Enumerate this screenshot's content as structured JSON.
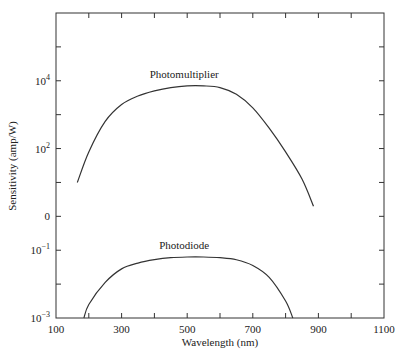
{
  "chart_data": {
    "type": "line",
    "title": "",
    "xlabel": "Wavelength (nm)",
    "ylabel": "Sensitivity (amp/W)",
    "xlim": [
      100,
      1100
    ],
    "x_ticks": [
      100,
      300,
      500,
      700,
      900,
      1100
    ],
    "x_minor_ticks": [
      200,
      400,
      600,
      800,
      1000
    ],
    "y_scale": "log (two stacked panels)",
    "y_ticks": [
      {
        "base": "10",
        "exp": "4",
        "log": 4
      },
      {
        "base": "10",
        "exp": "2",
        "log": 2
      },
      {
        "base": "0",
        "exp": "",
        "log": 0
      },
      {
        "base": "10",
        "exp": "−1",
        "log": -1
      },
      {
        "base": "10",
        "exp": "−3",
        "log": -3
      }
    ],
    "ylim_log": [
      -3,
      6
    ],
    "grid": false,
    "series": [
      {
        "name": "Photomultiplier",
        "x": [
          165,
          200,
          250,
          300,
          350,
          400,
          450,
          500,
          550,
          600,
          650,
          700,
          750,
          800,
          850,
          885
        ],
        "log_y": [
          1.0,
          1.9,
          2.8,
          3.3,
          3.55,
          3.7,
          3.8,
          3.85,
          3.85,
          3.8,
          3.6,
          3.2,
          2.6,
          1.9,
          1.1,
          0.3
        ]
      },
      {
        "name": "Photodiode",
        "x": [
          185,
          200,
          250,
          300,
          350,
          400,
          450,
          500,
          550,
          600,
          650,
          700,
          750,
          800,
          822
        ],
        "log_y": [
          -3.0,
          -2.6,
          -1.95,
          -1.55,
          -1.38,
          -1.28,
          -1.22,
          -1.2,
          -1.2,
          -1.22,
          -1.28,
          -1.45,
          -1.8,
          -2.5,
          -3.0
        ]
      }
    ]
  }
}
